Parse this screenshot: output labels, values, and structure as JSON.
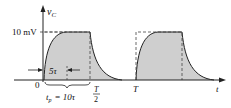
{
  "diagram": {
    "y_axis_label": "v",
    "y_axis_sub": "C",
    "x_axis_label": "t",
    "level_label": "10 mV",
    "origin_label": "0",
    "rise_label": "5τ",
    "tp_label_t": "t",
    "tp_label_sub": "p",
    "tp_label_rest": "= 10τ",
    "half_period_num": "T",
    "half_period_den": "2",
    "period_label": "T"
  },
  "colors": {
    "fill": "#c8c8c8",
    "line": "#222222",
    "dash": "#444444"
  }
}
